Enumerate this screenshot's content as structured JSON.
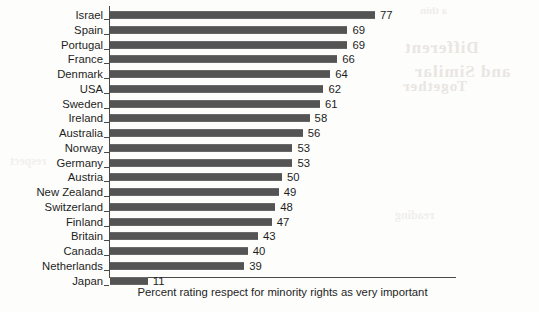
{
  "chart_data": {
    "type": "bar",
    "orientation": "horizontal",
    "title": "",
    "subtitle": "",
    "xlabel": "Percent rating respect for minority rights as very important",
    "ylabel": "",
    "xlim": [
      0,
      77
    ],
    "grid": false,
    "legend": null,
    "bar_color": "#5a5a5a",
    "axis_color": "#4a4a4a",
    "categories": [
      "Israel",
      "Spain",
      "Portugal",
      "France",
      "Denmark",
      "USA",
      "Sweden",
      "Ireland",
      "Australia",
      "Norway",
      "Germany",
      "Austria",
      "New Zealand",
      "Switzerland",
      "Finland",
      "Britain",
      "Canada",
      "Netherlands",
      "Japan"
    ],
    "values": [
      77,
      69,
      69,
      66,
      64,
      62,
      61,
      58,
      56,
      53,
      53,
      50,
      49,
      48,
      47,
      43,
      40,
      39,
      11
    ],
    "data_labels": [
      "77",
      "69",
      "69",
      "66",
      "64",
      "62",
      "61",
      "58",
      "56",
      "53",
      "53",
      "50",
      "49",
      "48",
      "47",
      "43",
      "40",
      "39",
      "11"
    ]
  },
  "background": {
    "bleed_artifacts": [
      "Different",
      "and Similar",
      "Together",
      "a thin",
      "reading",
      "respect"
    ]
  }
}
